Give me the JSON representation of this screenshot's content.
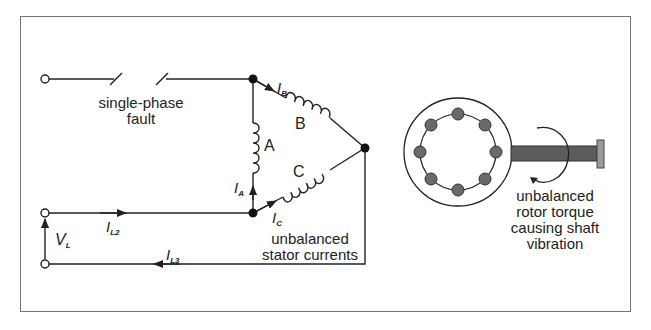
{
  "diagram": {
    "labels": {
      "fault": [
        "single-phase",
        "fault"
      ],
      "stator": [
        "unbalanced",
        "stator currents"
      ],
      "rotor": [
        "unbalanced",
        "rotor torque",
        "causing shaft",
        "vibration"
      ],
      "winding_a": "A",
      "winding_b": "B",
      "winding_c": "C"
    },
    "symbols": {
      "ib": {
        "main": "I",
        "sub": "B"
      },
      "ia": {
        "main": "I",
        "sub": "A"
      },
      "ic": {
        "main": "I",
        "sub": "C"
      },
      "il2": {
        "main": "I",
        "sub": "L2"
      },
      "il3": {
        "main": "I",
        "sub": "L3"
      },
      "vl": {
        "main": "V",
        "sub": "L"
      }
    },
    "colors": {
      "line": "#222222",
      "frame": "#777777",
      "rotor_bar": "#6a6a6a",
      "shaft": "#5c5c5c",
      "end_plate": "#9a9a9a"
    }
  }
}
